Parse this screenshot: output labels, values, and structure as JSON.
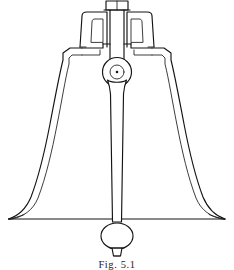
{
  "figure": {
    "caption": "Fig. 5.1",
    "background_color": "#ffffff",
    "ink_color": "#141414",
    "canvas": {
      "width": 234,
      "height": 270
    }
  },
  "parts": {
    "argent_block": "argent-block",
    "crown_staple": "crown-staple",
    "canon_left": "canon-loop-left",
    "canon_right": "canon-loop-right",
    "shoulder": "bell-shoulder",
    "waist_left": "bell-waist-left",
    "waist_right": "bell-waist-right",
    "soundbow_left": "bell-soundbow-left",
    "soundbow_right": "bell-soundbow-right",
    "mouth_line": "bell-mouth-line",
    "clapper_pivot": "clapper-pivot",
    "clapper_shaft": "clapper-shaft",
    "clapper_ball": "clapper-ball",
    "clapper_flight": "clapper-flight"
  },
  "geometry": {
    "mouth_y": 219,
    "mouth_left_x": 8,
    "mouth_right_x": 225,
    "center_x": 117,
    "shoulder_y": 48,
    "crown_top_y": 2,
    "pivot_center": [
      117,
      72
    ],
    "pivot_outer_r": 14.5,
    "pivot_inner_r": 7,
    "ball_center": [
      117,
      235
    ],
    "ball_rx": 16,
    "ball_ry": 13
  }
}
